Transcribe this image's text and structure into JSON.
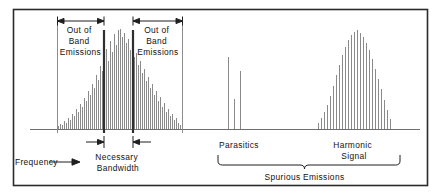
{
  "figure": {
    "axis_label": "Frequency",
    "labels": {
      "out_of_band_left": [
        "Out  of",
        "Band",
        "Emissions"
      ],
      "out_of_band_right": [
        "Out  of",
        "Band",
        "Emissions"
      ],
      "necessary_bandwidth": [
        "Necessary",
        "Bandwidth"
      ],
      "parasitics": "Parasitics",
      "harmonic_signal": [
        "Harmonic",
        "Signal"
      ],
      "spurious_emissions": "Spurious  Emissions"
    },
    "colors": {
      "frame": "#2b2b2b",
      "baseline": "#6f6f6f",
      "spectral_line": "#8a8a8a",
      "guide_dark": "#2f2f2f",
      "guide_light": "#8d8d8d",
      "text": "#121212",
      "background": "#ffffff"
    }
  },
  "chart_data": {
    "type": "bar",
    "xlabel": "Frequency",
    "ylabel": "",
    "grid": false,
    "legend_position": "none",
    "baseline_y": 129,
    "x_range": [
      30,
      420
    ],
    "y_range": [
      0,
      100
    ],
    "regions": [
      {
        "name": "out-of-band-left",
        "x_start": 57,
        "x_end": 104,
        "label": "Out of Band Emissions"
      },
      {
        "name": "necessary-bandwidth",
        "x_start": 104,
        "x_end": 133,
        "label": "Necessary Bandwidth"
      },
      {
        "name": "out-of-band-right",
        "x_start": 133,
        "x_end": 183,
        "label": "Out of Band Emissions"
      },
      {
        "name": "parasitics",
        "x_start": 226,
        "x_end": 248,
        "label": "Parasitics"
      },
      {
        "name": "harmonic-signal",
        "x_start": 318,
        "x_end": 392,
        "label": "Harmonic Signal"
      },
      {
        "name": "spurious-emissions",
        "x_start": 218,
        "x_end": 400,
        "label": "Spurious Emissions"
      }
    ],
    "series": [
      {
        "name": "main-lobe",
        "x": [
          58,
          60,
          62,
          64,
          66,
          68,
          70,
          72,
          74,
          76,
          78,
          80,
          82,
          84,
          86,
          88,
          90,
          92,
          94,
          96,
          98,
          100,
          102,
          104,
          106,
          108,
          110,
          112,
          114,
          116,
          118,
          120,
          122,
          124,
          126,
          128,
          130,
          132,
          134,
          136,
          138,
          140,
          142,
          144,
          146,
          148,
          150,
          152,
          154,
          156,
          158,
          160,
          162,
          164,
          166,
          168,
          170,
          172,
          174,
          176,
          178,
          180
        ],
        "values": [
          3,
          5,
          4,
          8,
          6,
          11,
          9,
          15,
          13,
          20,
          17,
          25,
          22,
          31,
          28,
          38,
          34,
          45,
          41,
          54,
          49,
          63,
          58,
          72,
          80,
          68,
          88,
          77,
          95,
          84,
          99,
          100,
          92,
          96,
          86,
          90,
          79,
          83,
          72,
          76,
          64,
          68,
          56,
          60,
          48,
          52,
          41,
          45,
          34,
          38,
          28,
          32,
          22,
          26,
          17,
          20,
          13,
          15,
          9,
          11,
          6,
          4
        ]
      },
      {
        "name": "parasitics",
        "x": [
          228,
          234,
          240
        ],
        "values": [
          72,
          30,
          58
        ]
      },
      {
        "name": "harmonic",
        "x": [
          318,
          321,
          324,
          327,
          330,
          333,
          336,
          339,
          342,
          345,
          348,
          351,
          354,
          357,
          360,
          363,
          366,
          369,
          372,
          375,
          378,
          381,
          384,
          387,
          390
        ],
        "values": [
          6,
          11,
          17,
          24,
          33,
          43,
          54,
          64,
          74,
          82,
          89,
          94,
          97,
          99,
          96,
          92,
          86,
          79,
          70,
          60,
          50,
          40,
          29,
          19,
          10
        ]
      }
    ]
  }
}
